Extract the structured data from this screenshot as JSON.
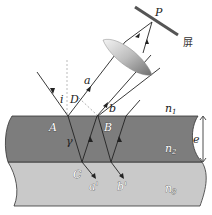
{
  "diagram": {
    "labels": {
      "P": "P",
      "screen": "屏",
      "a": "a",
      "b": "b",
      "i": "i",
      "D": "D",
      "A": "A",
      "B": "B",
      "C": "C",
      "r": "γ",
      "a_prime": "a'",
      "b_prime": "b'",
      "n1": "n",
      "n1_sub": "1",
      "n2": "n",
      "n2_sub": "2",
      "n3": "n",
      "n3_sub": "3",
      "e": "e"
    },
    "colors": {
      "film": "#7a7a7a",
      "substrate": "#c8c8c8",
      "line": "#222222",
      "dashed": "#999999"
    }
  }
}
